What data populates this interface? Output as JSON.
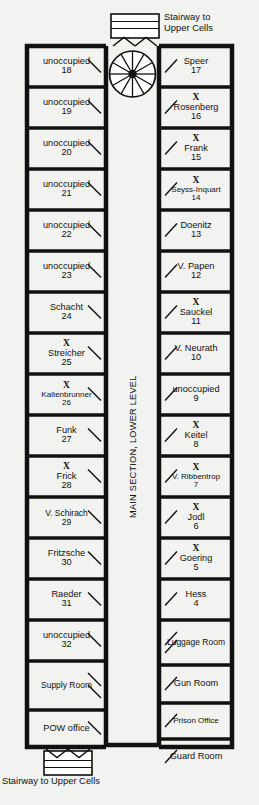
{
  "diagram": {
    "corridor_label": "MAIN SECTION, LOWER LEVEL",
    "top_stairway_caption_line1": "Stairway to",
    "top_stairway_caption_line2": "Upper Cells",
    "bottom_stairway_caption": "Stairway to Upper Cells",
    "colors": {
      "background": "#f2f2f0",
      "wall": "#111111",
      "room_fill": "#ffffff",
      "text": "#111111"
    }
  },
  "left_column": [
    {
      "name": "unoccupied",
      "number": "18",
      "marked": false
    },
    {
      "name": "unoccupied",
      "number": "19",
      "marked": false
    },
    {
      "name": "unoccupied",
      "number": "20",
      "marked": false
    },
    {
      "name": "unoccupied",
      "number": "21",
      "marked": false
    },
    {
      "name": "unoccupied",
      "number": "22",
      "marked": false
    },
    {
      "name": "unoccupied",
      "number": "23",
      "marked": false
    },
    {
      "name": "Schacht",
      "number": "24",
      "marked": false
    },
    {
      "name": "Streicher",
      "number": "25",
      "marked": true,
      "mark": "X"
    },
    {
      "name": "Kaltenbrunner",
      "number": "26",
      "marked": true,
      "mark": "X"
    },
    {
      "name": "Funk",
      "number": "27",
      "marked": false
    },
    {
      "name": "Frick",
      "number": "28",
      "marked": true,
      "mark": "X"
    },
    {
      "name": "V. Schirach",
      "number": "29",
      "marked": false
    },
    {
      "name": "Fritzsche",
      "number": "30",
      "marked": false
    },
    {
      "name": "Raeder",
      "number": "31",
      "marked": false
    },
    {
      "name": "unoccupied",
      "number": "32",
      "marked": false
    },
    {
      "name": "Supply Room",
      "number": "",
      "marked": false
    },
    {
      "name": "POW office",
      "number": "",
      "marked": false
    }
  ],
  "right_column": [
    {
      "name": "Speer",
      "number": "17",
      "marked": false
    },
    {
      "name": "Rosenberg",
      "number": "16",
      "marked": true,
      "mark": "X"
    },
    {
      "name": "Frank",
      "number": "15",
      "marked": true,
      "mark": "X"
    },
    {
      "name": "Seyss-Inquart",
      "number": "14",
      "marked": true,
      "mark": "X"
    },
    {
      "name": "Doenitz",
      "number": "13",
      "marked": false
    },
    {
      "name": "V. Papen",
      "number": "12",
      "marked": false
    },
    {
      "name": "Sauckel",
      "number": "11",
      "marked": true,
      "mark": "X"
    },
    {
      "name": "V. Neurath",
      "number": "10",
      "marked": false
    },
    {
      "name": "unoccupied",
      "number": "9",
      "marked": false
    },
    {
      "name": "Keitel",
      "number": "8",
      "marked": true,
      "mark": "X"
    },
    {
      "name": "V. Ribbentrop",
      "number": "7",
      "marked": true,
      "mark": "X"
    },
    {
      "name": "Jodl",
      "number": "6",
      "marked": true,
      "mark": "X"
    },
    {
      "name": "Goering",
      "number": "5",
      "marked": true,
      "mark": "X"
    },
    {
      "name": "Hess",
      "number": "4",
      "marked": false
    },
    {
      "name": "Luggage Room",
      "number": "",
      "marked": false
    },
    {
      "name": "Gun Room",
      "number": "",
      "marked": false
    },
    {
      "name": "Prison Office",
      "number": "",
      "marked": false
    },
    {
      "name": "Guard Room",
      "number": "",
      "marked": false
    }
  ]
}
